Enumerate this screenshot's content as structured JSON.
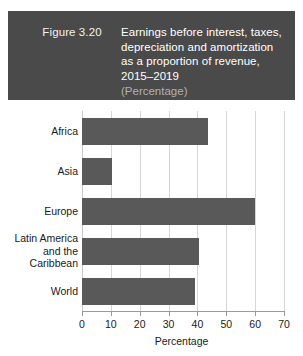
{
  "header": {
    "figure_number": "Figure 3.20",
    "title_lines": [
      "Earnings before interest, taxes,",
      "depreciation and amortization",
      "as a proportion of revenue,",
      "2015–2019"
    ],
    "subtitle": "(Percentage)",
    "background_color": "#4a4a4a",
    "title_color": "#ffffff",
    "subtitle_color": "#b0b0b0"
  },
  "chart_data": {
    "type": "bar",
    "orientation": "horizontal",
    "title": "Earnings before interest, taxes, depreciation and amortization as a proportion of revenue, 2015–2019",
    "subtitle": "(Percentage)",
    "categories": [
      "Africa",
      "Asia",
      "Europe",
      "Latin America and the Caribbean",
      "World"
    ],
    "category_label_lines": [
      [
        "Africa"
      ],
      [
        "Asia"
      ],
      [
        "Europe"
      ],
      [
        "Latin America",
        "and the",
        "Caribbean"
      ],
      [
        "World"
      ]
    ],
    "values": [
      43.5,
      10.5,
      60.0,
      40.5,
      39.0
    ],
    "xlabel": "Percentage",
    "ylabel": "",
    "xlim": [
      0,
      70
    ],
    "xticks": [
      0,
      10,
      20,
      30,
      40,
      50,
      60,
      70
    ],
    "tick_labels": [
      "0",
      "10",
      "20",
      "30",
      "40",
      "50",
      "60",
      "70"
    ],
    "grid": "vertical",
    "legend": null,
    "bar_color": "#595959",
    "grid_color": "#d6d6d6"
  }
}
